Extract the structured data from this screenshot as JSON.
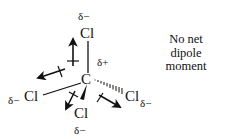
{
  "figure": {
    "type": "molecular-dipole-diagram",
    "molecule": "CCl4",
    "central_atom": {
      "label": "C",
      "partial_charge": "δ+"
    },
    "substituents": [
      {
        "position": "top",
        "label": "Cl",
        "partial_charge": "δ−",
        "bond": "plain"
      },
      {
        "position": "left",
        "label": "Cl",
        "partial_charge": "δ−",
        "bond": "plain"
      },
      {
        "position": "bottom",
        "label": "Cl",
        "partial_charge": "δ−",
        "bond": "wedge"
      },
      {
        "position": "right",
        "label": "Cl",
        "partial_charge": "δ−",
        "bond": "hashed"
      }
    ],
    "dipole_arrows": [
      {
        "toward": "top"
      },
      {
        "toward": "left"
      },
      {
        "toward": "bottom"
      },
      {
        "toward": "right"
      }
    ],
    "caption": {
      "lines": [
        "No net",
        "dipole",
        "moment"
      ]
    },
    "colors": {
      "ink": "#111111",
      "background": "#ffffff"
    }
  }
}
